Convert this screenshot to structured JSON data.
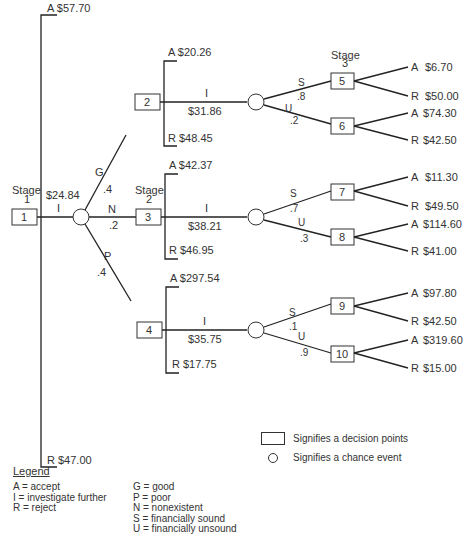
{
  "stage1": {
    "stage_label": "Stage",
    "stage_num": "1",
    "node_id": "1",
    "accept": "A $57.70",
    "reject": "R $47.00",
    "investigate_letter": "I",
    "investigate_value": "$24.84"
  },
  "chance1": {
    "branches": [
      {
        "letter": "G",
        "prob": ".4"
      },
      {
        "letter": "N",
        "prob": ".2"
      },
      {
        "letter": "P",
        "prob": ".4"
      }
    ]
  },
  "stage2_label": {
    "stage_label": "Stage",
    "stage_num": "2"
  },
  "stage3_label": {
    "stage_label": "Stage",
    "stage_num": "3"
  },
  "stage2_nodes": [
    {
      "node_id": "2",
      "accept": "A $20.26",
      "reject": "R $48.45",
      "investigate_letter": "I",
      "investigate_value": "$31.86",
      "sound": {
        "letter": "S",
        "prob": ".8"
      },
      "unsound": {
        "letter": "U",
        "prob": ".2"
      }
    },
    {
      "node_id": "3",
      "accept": "A $42.37",
      "reject": "R $46.95",
      "investigate_letter": "I",
      "investigate_value": "$38.21",
      "sound": {
        "letter": "S",
        "prob": ".7"
      },
      "unsound": {
        "letter": "U",
        "prob": ".3"
      }
    },
    {
      "node_id": "4",
      "accept": "A $297.54",
      "reject": "R $17.75",
      "investigate_letter": "I",
      "investigate_value": "$35.75",
      "sound": {
        "letter": "S",
        "prob": ".1"
      },
      "unsound": {
        "letter": "U",
        "prob": ".9"
      }
    }
  ],
  "stage3_nodes": [
    {
      "node_id": "5",
      "accept_letter": "A",
      "accept_value": "$6.70",
      "reject_letter": "R",
      "reject_value": "$50.00"
    },
    {
      "node_id": "6",
      "accept_letter": "A",
      "accept_value": "$74.30",
      "reject_letter": "R",
      "reject_value": "$42.50"
    },
    {
      "node_id": "7",
      "accept_letter": "A",
      "accept_value": "$11.30",
      "reject_letter": "R",
      "reject_value": "$49.50"
    },
    {
      "node_id": "8",
      "accept_letter": "A",
      "accept_value": "$114.60",
      "reject_letter": "R",
      "reject_value": "$41.00"
    },
    {
      "node_id": "9",
      "accept_letter": "A",
      "accept_value": "$97.80",
      "reject_letter": "R",
      "reject_value": "$42.50"
    },
    {
      "node_id": "10",
      "accept_letter": "A",
      "accept_value": "$319.60",
      "reject_letter": "R",
      "reject_value": "$15.00"
    }
  ],
  "legend": {
    "title": "Legend",
    "left_col": [
      "A = accept",
      "I = investigate further",
      "R = reject"
    ],
    "right_col": [
      "G = good",
      "P = poor",
      "N = nonexistent",
      "S = financially sound",
      "U = financially unsound"
    ],
    "decision_symbol_label": "Signifies a decision points",
    "chance_symbol_label": "Signifies a chance event"
  }
}
